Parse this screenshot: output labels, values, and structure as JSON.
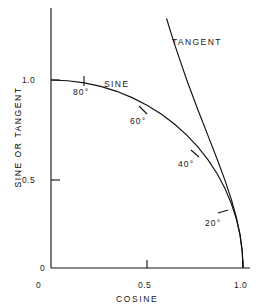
{
  "chart_data": {
    "type": "line",
    "title": "",
    "xlabel": "COSINE",
    "ylabel": "SINE OR TANGENT",
    "xlim": [
      0,
      1.08
    ],
    "ylim": [
      0,
      1.42
    ],
    "grid": false,
    "legend": "inline-annotations",
    "xticks": [
      {
        "value": 0,
        "label": "0"
      },
      {
        "value": 0.5,
        "label": "0.5"
      },
      {
        "value": 1.0,
        "label": "1.0"
      }
    ],
    "yticks": [
      {
        "value": 0,
        "label": "0"
      },
      {
        "value": 0.5,
        "label": "0.5"
      },
      {
        "value": 1.0,
        "label": "1.0"
      }
    ],
    "series": [
      {
        "name": "SINE",
        "description": "sine plotted against cosine (unit quarter circle)",
        "x": [
          0.0,
          0.0872,
          0.1736,
          0.2588,
          0.342,
          0.4226,
          0.5,
          0.5736,
          0.6428,
          0.7071,
          0.766,
          0.8192,
          0.866,
          0.9063,
          0.9397,
          0.9659,
          0.9848,
          0.9962,
          1.0
        ],
        "y": [
          1.0,
          0.9962,
          0.9848,
          0.9659,
          0.9397,
          0.9063,
          0.866,
          0.8192,
          0.766,
          0.7071,
          0.6428,
          0.5736,
          0.5,
          0.4226,
          0.342,
          0.2588,
          0.1736,
          0.0872,
          0.0
        ]
      },
      {
        "name": "TANGENT",
        "description": "tangent plotted against cosine",
        "x": [
          0.6018,
          0.6428,
          0.7071,
          0.766,
          0.8192,
          0.866,
          0.9063,
          0.9397,
          0.9659,
          0.9848,
          0.9962,
          1.0
        ],
        "y": [
          1.327,
          1.1918,
          1.0,
          0.8391,
          0.7002,
          0.5774,
          0.4663,
          0.364,
          0.2679,
          0.1763,
          0.0875,
          0.0
        ]
      }
    ],
    "annotations": [
      {
        "label": "SINE",
        "series": "SINE",
        "x": 0.34,
        "y": 1.02
      },
      {
        "label": "TANGENT",
        "series": "TANGENT",
        "x": 0.7,
        "y": 1.21
      },
      {
        "label": "80°",
        "marker": true,
        "x": 0.1736,
        "y": 0.9848
      },
      {
        "label": "60°",
        "marker": true,
        "x": 0.5,
        "y": 0.866
      },
      {
        "label": "40°",
        "marker": true,
        "x": 0.766,
        "y": 0.6428
      },
      {
        "label": "20°",
        "marker": true,
        "x": 0.9397,
        "y": 0.342
      }
    ]
  },
  "axes": {
    "x_title": "COSINE",
    "y_title": "SINE OR TANGENT",
    "x_tick_labels": [
      "0",
      "0.5",
      "1.0"
    ],
    "y_tick_labels": [
      "0",
      "0.5",
      "1.0"
    ]
  },
  "labels": {
    "sine": "SINE",
    "tangent": "TANGENT",
    "angle_80": "80°",
    "angle_60": "60°",
    "angle_40": "40°",
    "angle_20": "20°"
  },
  "style": {
    "line_color": "#111111",
    "axis_color": "#111111",
    "text_color": "#1a1a1a",
    "background": "#ffffff"
  }
}
